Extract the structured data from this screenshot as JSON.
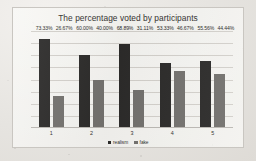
{
  "chart_data": {
    "type": "bar",
    "title": "The percentage voted by participants",
    "xlabel": "",
    "ylabel": "",
    "categories": [
      "1",
      "2",
      "3",
      "4",
      "5"
    ],
    "series": [
      {
        "name": "realism",
        "color": "#262524",
        "values": [
          73.33,
          60.0,
          68.89,
          53.33,
          55.56
        ],
        "labels": [
          "73.33%",
          "60.00%",
          "68.89%",
          "53.33%",
          "55.56%"
        ]
      },
      {
        "name": "fake",
        "color": "#6f6d6a",
        "values": [
          26.67,
          40.0,
          31.11,
          46.67,
          44.44
        ],
        "labels": [
          "26.67%",
          "40.00%",
          "31.11%",
          "46.67%",
          "44.44%"
        ]
      }
    ],
    "ylim": [
      0,
      80
    ],
    "grid": true,
    "gridline_count": 8,
    "legend_position": "bottom"
  }
}
